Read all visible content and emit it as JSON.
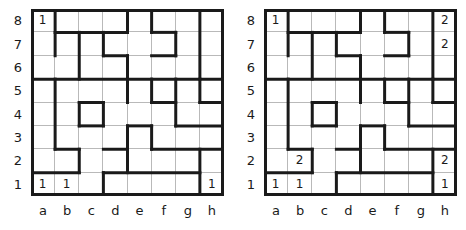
{
  "figure": {
    "type": "logic-puzzle-grid-pair",
    "grid_size": {
      "cols": 8,
      "rows": 8
    },
    "colors": {
      "wall": "#1a1a1a",
      "thin_gridline": "#b9b9b9",
      "background": "#ffffff",
      "text": "#1a1a1a"
    }
  },
  "axis": {
    "col_labels": [
      "a",
      "b",
      "c",
      "d",
      "e",
      "f",
      "g",
      "h"
    ],
    "row_labels": [
      "8",
      "7",
      "6",
      "5",
      "4",
      "3",
      "2",
      "1"
    ]
  },
  "panels": [
    {
      "id": "left-grid",
      "name": "Puzzle grid left",
      "clues": [
        {
          "cell": "a8",
          "col": 0,
          "row": 0,
          "value": "1"
        },
        {
          "cell": "a1",
          "col": 0,
          "row": 7,
          "value": "1"
        },
        {
          "cell": "b1",
          "col": 1,
          "row": 7,
          "value": "1"
        },
        {
          "cell": "h1",
          "col": 7,
          "row": 7,
          "value": "1"
        }
      ]
    },
    {
      "id": "right-grid",
      "name": "Puzzle grid right",
      "clues": [
        {
          "cell": "a8",
          "col": 0,
          "row": 0,
          "value": "1"
        },
        {
          "cell": "h8",
          "col": 7,
          "row": 0,
          "value": "2"
        },
        {
          "cell": "h7",
          "col": 7,
          "row": 1,
          "value": "2"
        },
        {
          "cell": "b2",
          "col": 1,
          "row": 6,
          "value": "2"
        },
        {
          "cell": "h2",
          "col": 7,
          "row": 6,
          "value": "2"
        },
        {
          "cell": "a1",
          "col": 0,
          "row": 7,
          "value": "1"
        },
        {
          "cell": "b1",
          "col": 1,
          "row": 7,
          "value": "1"
        },
        {
          "cell": "h1",
          "col": 7,
          "row": 7,
          "value": "1"
        }
      ]
    }
  ],
  "walls": {
    "note": "Shared bold wall segments for both grids. Coordinates are grid-node indices: x 0..8 left-to-right, y 0..8 top-to-bottom (y=0 is the top of row 8).",
    "horizontal": [
      {
        "y": 1,
        "x1": 1,
        "x2": 4
      },
      {
        "y": 1,
        "x1": 5,
        "x2": 6
      },
      {
        "y": 2,
        "x1": 3,
        "x2": 4
      },
      {
        "y": 2,
        "x1": 5,
        "x2": 6
      },
      {
        "y": 3,
        "x1": 0,
        "x2": 8
      },
      {
        "y": 4,
        "x1": 2,
        "x2": 3
      },
      {
        "y": 4,
        "x1": 5,
        "x2": 6
      },
      {
        "y": 4,
        "x1": 7,
        "x2": 8
      },
      {
        "y": 5,
        "x1": 2,
        "x2": 3
      },
      {
        "y": 5,
        "x1": 4,
        "x2": 5
      },
      {
        "y": 5,
        "x1": 6,
        "x2": 8
      },
      {
        "y": 6,
        "x1": 1,
        "x2": 2
      },
      {
        "y": 6,
        "x1": 3,
        "x2": 4
      },
      {
        "y": 6,
        "x1": 5,
        "x2": 8
      },
      {
        "y": 7,
        "x1": 0,
        "x2": 2
      },
      {
        "y": 7,
        "x1": 3,
        "x2": 7
      }
    ],
    "vertical": [
      {
        "x": 1,
        "y1": 0,
        "y2": 2
      },
      {
        "x": 2,
        "y1": 1,
        "y2": 3
      },
      {
        "x": 3,
        "y1": 1,
        "y2": 2
      },
      {
        "x": 4,
        "y1": 0,
        "y2": 1
      },
      {
        "x": 4,
        "y1": 2,
        "y2": 3
      },
      {
        "x": 5,
        "y1": 0,
        "y2": 1
      },
      {
        "x": 6,
        "y1": 1,
        "y2": 2
      },
      {
        "x": 7,
        "y1": 0,
        "y2": 3
      },
      {
        "x": 1,
        "y1": 3,
        "y2": 6
      },
      {
        "x": 2,
        "y1": 4,
        "y2": 5
      },
      {
        "x": 3,
        "y1": 4,
        "y2": 5
      },
      {
        "x": 4,
        "y1": 3,
        "y2": 4
      },
      {
        "x": 4,
        "y1": 5,
        "y2": 7
      },
      {
        "x": 5,
        "y1": 3,
        "y2": 4
      },
      {
        "x": 5,
        "y1": 5,
        "y2": 6
      },
      {
        "x": 6,
        "y1": 3,
        "y2": 5
      },
      {
        "x": 7,
        "y1": 3,
        "y2": 4
      },
      {
        "x": 7,
        "y1": 6,
        "y2": 8
      },
      {
        "x": 3,
        "y1": 7,
        "y2": 8
      },
      {
        "x": 2,
        "y1": 6,
        "y2": 7
      }
    ]
  }
}
